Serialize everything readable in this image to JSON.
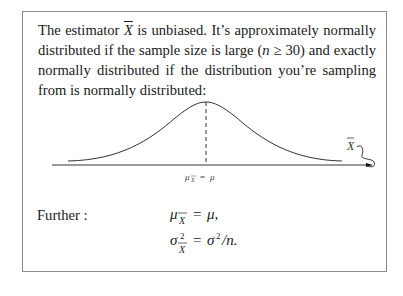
{
  "paragraph": {
    "part1": "The estimator ",
    "xbar": "X",
    "part2": " is unbiased. It’s approximately normally distributed if the sample size is large (",
    "n": "n",
    "part3": " ≥ 30) and exactly normally distributed if the distribution you’re sampling from is normally distributed:"
  },
  "figure": {
    "axis_label": "μX̄ = μ",
    "mean_label_mu": "μ",
    "mean_label_sub": "X̄",
    "mean_label_rhs": "= μ",
    "curve_label": "X̄",
    "colors": {
      "line": "#333333"
    }
  },
  "further": {
    "label": "Further :",
    "eq1": "μX̄ = μ,",
    "eq2": "σ²X̄ = σ²/n."
  }
}
